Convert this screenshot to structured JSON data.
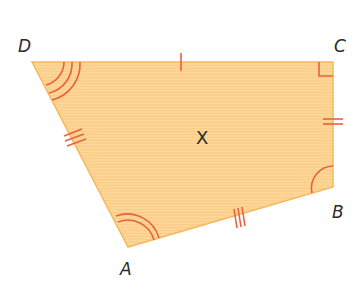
{
  "diagram": {
    "type": "quadrilateral",
    "fill_color": "#fcd597",
    "stroke_color": "#f5b95c",
    "mark_color": "#e8623a",
    "vertices": [
      {
        "name": "D",
        "x": 32,
        "y": 62,
        "label_x": 18,
        "label_y": 52,
        "angle_marks": 3
      },
      {
        "name": "C",
        "x": 333,
        "y": 62,
        "label_x": 334,
        "label_y": 52,
        "angle_marks": "right"
      },
      {
        "name": "B",
        "x": 333,
        "y": 187,
        "label_x": 332,
        "label_y": 218,
        "angle_marks": 1
      },
      {
        "name": "A",
        "x": 128,
        "y": 247,
        "label_x": 120,
        "label_y": 275,
        "angle_marks": 2
      }
    ],
    "sides": [
      {
        "from": "D",
        "to": "C",
        "tick_marks": 1
      },
      {
        "from": "C",
        "to": "B",
        "tick_marks": 2
      },
      {
        "from": "B",
        "to": "A",
        "tick_marks": 3
      },
      {
        "from": "A",
        "to": "D",
        "tick_marks": 3
      }
    ],
    "center_label": "X",
    "labels": {
      "D": "D",
      "C": "C",
      "B": "B",
      "A": "A"
    }
  }
}
